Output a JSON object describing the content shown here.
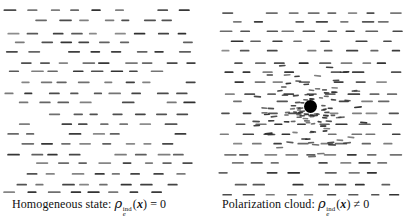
{
  "captions": {
    "left": {
      "prefix": "Homogeneous state: ",
      "rho": "ρ",
      "sup": "ind",
      "sub": "e",
      "open_paren": "(",
      "x": "x",
      "close_paren": ")",
      "relation": "=",
      "value": "0"
    },
    "right": {
      "prefix": "Polarization cloud: ",
      "rho": "ρ",
      "sup": "ind",
      "sub": "e",
      "open_paren": "(",
      "x": "x",
      "close_paren": ")",
      "relation": "≠",
      "value": "0"
    }
  },
  "diagram": {
    "dash_color": "#2f2f2f",
    "dot_color": "#000000",
    "panels": [
      {
        "name": "homogeneous-field",
        "x0": 7,
        "y0": 11,
        "width": 190,
        "rows": 19,
        "cols": 9,
        "dx": 21,
        "dy": 10.1,
        "jitter_x": 4,
        "jitter_y": 1.7,
        "dash_len": 10.5,
        "dash_len_jitter": 2.5,
        "dash_h": 1.7,
        "skip_prob": 0.1,
        "seed": 7
      },
      {
        "name": "polarization-field",
        "x0": 222,
        "y0": 11,
        "width": 184,
        "rows": 19,
        "cols": 9,
        "dx": 21,
        "dy": 10.1,
        "jitter_x": 4,
        "jitter_y": 1.7,
        "dash_len": 10.5,
        "dash_len_jitter": 2.5,
        "dash_h": 1.7,
        "skip_prob": 0.1,
        "seed": 41,
        "hole": {
          "cx": 310.5,
          "cy": 106.5,
          "r": 13
        }
      }
    ],
    "cloud": {
      "name": "polarization-cloud",
      "cx": 310.5,
      "cy": 106.5,
      "count": 110,
      "r_min": 9,
      "r_max": 58,
      "bias": 1.5,
      "squash": 0.85,
      "len_base": 4.2,
      "len_slope": 0.06,
      "dash_h": 1.6,
      "max_tilt_deg": 14,
      "seed": 97
    },
    "dot": {
      "cx": 310.5,
      "cy": 106.5,
      "r": 6.5
    }
  }
}
